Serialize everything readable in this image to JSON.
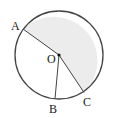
{
  "diagram": {
    "type": "circle-sector",
    "labels": {
      "A": "A",
      "B": "B",
      "C": "C",
      "O": "O"
    },
    "points": [
      "A",
      "B",
      "C"
    ],
    "center": "O",
    "shaded_region": "sector AOC (major side through top)",
    "segments": [
      "AO",
      "OC",
      "OB"
    ],
    "colors": {
      "shade": "#ececec",
      "stroke": "#444444"
    }
  }
}
